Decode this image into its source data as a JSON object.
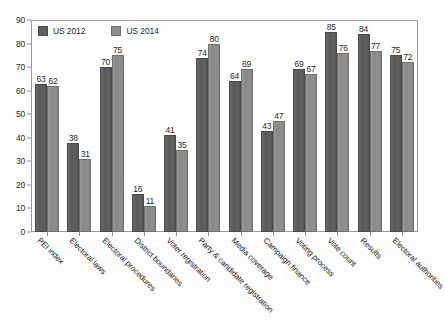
{
  "chart_data": {
    "type": "bar",
    "title": "",
    "subtitle": "",
    "xlabel": "",
    "ylabel": "",
    "ylim": [
      0,
      90
    ],
    "ytick_step": 10,
    "yticks": [
      0,
      10,
      20,
      30,
      40,
      50,
      60,
      70,
      80,
      90
    ],
    "grid": false,
    "legend_position": "top-left",
    "categories": [
      "PEI index",
      "Electoral laws",
      "Electoral procedures",
      "District boundaries",
      "Voter registration",
      "Party & candidate registration",
      "Media coverage",
      "Campaign finance",
      "Voting process",
      "Vote count",
      "Results",
      "Electoral authorities"
    ],
    "series": [
      {
        "name": "US 2012",
        "color": "#5e5e5e",
        "values": [
          63,
          38,
          70,
          16,
          41,
          74,
          64,
          43,
          69,
          85,
          84,
          75
        ]
      },
      {
        "name": "US 2014",
        "color": "#8e8e8e",
        "values": [
          62,
          31,
          75,
          11,
          35,
          80,
          69,
          47,
          67,
          76,
          77,
          72
        ]
      }
    ]
  },
  "legend": {
    "items": [
      {
        "label": "US 2012",
        "swatch": "legend-swatch-dark"
      },
      {
        "label": "US 2014",
        "swatch": "legend-swatch-light"
      }
    ]
  }
}
